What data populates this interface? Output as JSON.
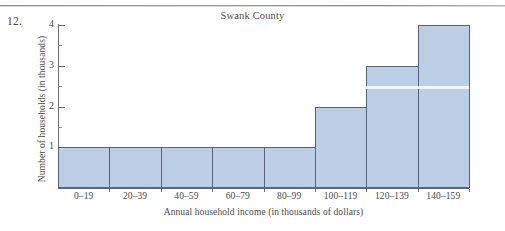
{
  "exercise": {
    "number": "12."
  },
  "figure": {
    "title": "Swank County",
    "x_axis_title": "Annual household income (in thousands of dollars)",
    "y_axis_title": "Number of households (in thousands)"
  },
  "chart_data": {
    "type": "bar",
    "title": "Swank County",
    "xlabel": "Annual household income (in thousands of dollars)",
    "ylabel": "Number of households (in thousands)",
    "categories": [
      "0–19",
      "20–39",
      "40–59",
      "60–79",
      "80–99",
      "100–119",
      "120–139",
      "140–159"
    ],
    "values": [
      1,
      1,
      1,
      1,
      1,
      2,
      3,
      4
    ],
    "ylim": [
      0,
      4
    ],
    "y_ticks": [
      1,
      2,
      3,
      4
    ],
    "y_tick_labels": [
      "1",
      "2",
      "3",
      "4"
    ],
    "y_minor_ticks": [
      0.5,
      1.5,
      2.5,
      3.5
    ],
    "grid": false,
    "legend": false,
    "bar_fill_color": "#bccde6",
    "bar_border_color": "#55627a",
    "background_color": "#ffffff"
  }
}
